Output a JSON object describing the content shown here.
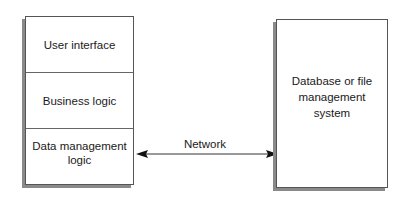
{
  "diagram": {
    "client_stack": {
      "layers": [
        {
          "label": "User interface"
        },
        {
          "label": "Business logic"
        },
        {
          "label": "Data management logic"
        }
      ]
    },
    "server": {
      "label": "Database or file management system"
    },
    "connection": {
      "label": "Network",
      "direction": "bidirectional"
    },
    "colors": {
      "border": "#555555",
      "shadow": "#8a8a8a",
      "text": "#1a1a1a",
      "background": "#ffffff"
    }
  }
}
